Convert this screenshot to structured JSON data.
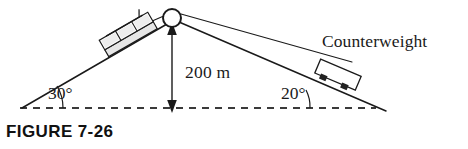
{
  "figure": {
    "caption": "FIGURE 7-26",
    "type": "physics-diagram"
  },
  "labels": {
    "counterweight": "Counterweight",
    "height": "200 m",
    "angle_left": "30°",
    "angle_right": "20°"
  },
  "diagram_data": {
    "type": "schematic",
    "background": "#ffffff",
    "line_color": "#1a1a1a",
    "fill_color": "#ffffff",
    "shade_color": "#d8d8d8",
    "dash_color": "#3a3a3a",
    "summit": {
      "x": 172,
      "y": 18,
      "pulley_radius": 9
    },
    "left_slope": {
      "angle_deg": 30,
      "base_point": {
        "x": 22,
        "y": 108
      },
      "top_point": {
        "x": 166,
        "y": 24
      }
    },
    "right_slope": {
      "angle_deg": 20,
      "top_point": {
        "x": 180,
        "y": 23
      },
      "base_point": {
        "x": 386,
        "y": 111
      }
    },
    "height_arrow": {
      "value": 200,
      "unit": "m",
      "from": {
        "x": 172,
        "y": 27
      },
      "to": {
        "x": 172,
        "y": 108
      },
      "double_headed": true
    },
    "baseline": {
      "style": "dashed",
      "from": {
        "x": 20,
        "y": 108
      },
      "to": {
        "x": 376,
        "y": 108
      }
    },
    "cable_car": {
      "name": "cable-car",
      "center": {
        "x": 128,
        "y": 34
      },
      "segments": 3,
      "on_slope_angle_deg": 30
    },
    "counterweight_box": {
      "name": "counterweight-box",
      "center": {
        "x": 337,
        "y": 78
      },
      "on_slope_angle_deg": 20,
      "clamp_count": 2
    }
  }
}
